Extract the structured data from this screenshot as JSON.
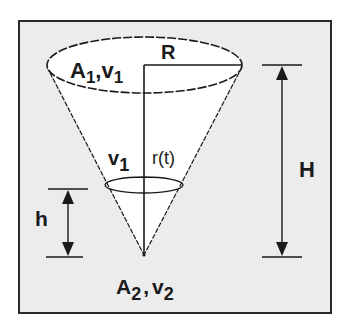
{
  "figure": {
    "labels": {
      "top_area": "A",
      "top_area_sub": "1",
      "top_velocity": "v",
      "top_velocity_sub": "1",
      "radius": "R",
      "level_velocity": "v",
      "level_velocity_sub": "1",
      "level_radius": "r(t)",
      "height_total": "H",
      "height_level": "h",
      "outlet_area": "A",
      "outlet_area_sub": "2",
      "outlet_velocity": "v",
      "outlet_velocity_sub": "2",
      "separator": ","
    },
    "colors": {
      "frame_background": "#ececec",
      "cone_fill": "#ffffff",
      "line": "#1a1a1a"
    }
  }
}
